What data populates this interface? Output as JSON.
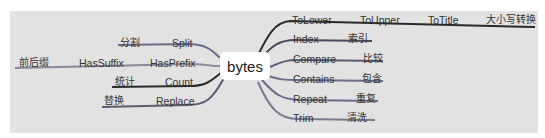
{
  "diagram": {
    "type": "mind-map",
    "root": "bytes",
    "colors": {
      "background": "#e2e2e2",
      "dark_line": "#2a2a2a",
      "purple_line": "#6b6a8a",
      "gray_line": "#8a8a9a",
      "root_fill": "#ffffff"
    },
    "left_branches": [
      {
        "en": "Split",
        "cn": "分割"
      },
      {
        "en": "HasPrefix",
        "mid": "HasSuffix",
        "cn": "前后缀"
      },
      {
        "en": "Count",
        "cn": "统计"
      },
      {
        "en": "Replace",
        "cn": "替换"
      }
    ],
    "right_branches": [
      {
        "en": "ToLower",
        "mid1": "ToUpper",
        "mid2": "ToTitle",
        "cn": "大小写转换"
      },
      {
        "en": "Index",
        "cn": "索引"
      },
      {
        "en": "Compare",
        "cn": "比较"
      },
      {
        "en": "Contains",
        "cn": "包含"
      },
      {
        "en": "Repeat",
        "cn": "重复"
      },
      {
        "en": "Trim",
        "cn": "清洗"
      }
    ]
  }
}
